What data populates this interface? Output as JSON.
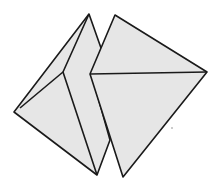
{
  "diagram": {
    "fill_color": "#e6e6e6",
    "stroke_color": "#1a1a1a",
    "left_shape": {
      "outline": [
        [
          89,
          14
        ],
        [
          14,
          112
        ],
        [
          97,
          175
        ],
        [
          110,
          140
        ],
        [
          96,
          90
        ],
        [
          100,
          50
        ]
      ],
      "folds": [
        [
          [
            89,
            14
          ],
          [
            63,
            72
          ],
          [
            97,
            175
          ]
        ],
        [
          [
            63,
            72
          ],
          [
            20,
            110
          ]
        ]
      ]
    },
    "right_shape": {
      "outline": [
        [
          115,
          15
        ],
        [
          207,
          72
        ],
        [
          123,
          177
        ],
        [
          90,
          74
        ]
      ],
      "folds": [
        [
          [
            90,
            74
          ],
          [
            207,
            72
          ]
        ]
      ]
    },
    "dot": [
      172,
      128
    ]
  }
}
